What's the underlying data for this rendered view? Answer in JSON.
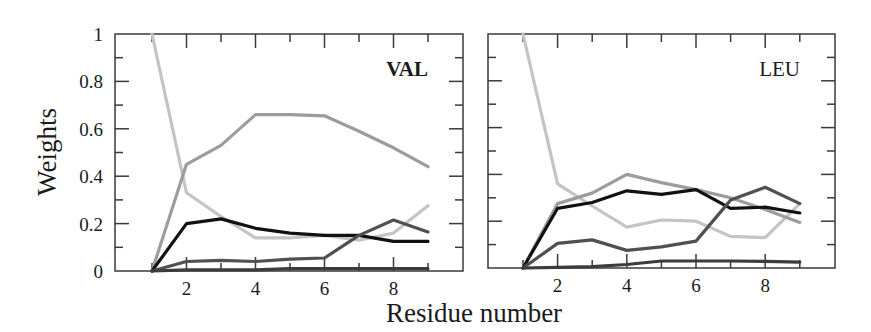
{
  "chart_data": [
    {
      "type": "line",
      "panel_label": "VAL",
      "panel_label_bold": true,
      "xlabel": "Residue number",
      "ylabel": "Weights",
      "xlim": [
        0,
        10
      ],
      "ylim": [
        0,
        1
      ],
      "x_ticks_labeled": [
        2,
        4,
        6,
        8
      ],
      "y_ticks_labeled": [
        "0",
        "0.2",
        "0.4",
        "0.6",
        "0.8",
        "1"
      ],
      "grid": false,
      "legend": null,
      "x": [
        1,
        2,
        3,
        4,
        5,
        6,
        7,
        8,
        9
      ],
      "series": [
        {
          "name": "light-gray",
          "color": "#c4c4c4",
          "values": [
            1.0,
            0.33,
            0.23,
            0.14,
            0.14,
            0.15,
            0.13,
            0.16,
            0.275
          ]
        },
        {
          "name": "mid-gray",
          "color": "#9c9c9c",
          "values": [
            0.0,
            0.45,
            0.53,
            0.66,
            0.66,
            0.655,
            0.59,
            0.52,
            0.44
          ]
        },
        {
          "name": "black",
          "color": "#111111",
          "values": [
            0.0,
            0.2,
            0.22,
            0.18,
            0.16,
            0.15,
            0.15,
            0.125,
            0.125
          ]
        },
        {
          "name": "dark-gray",
          "color": "#505050",
          "values": [
            0.0,
            0.04,
            0.045,
            0.04,
            0.05,
            0.055,
            0.15,
            0.215,
            0.165
          ]
        },
        {
          "name": "darkest-gray",
          "color": "#3c3c3c",
          "values": [
            0.0,
            0.005,
            0.005,
            0.005,
            0.01,
            0.01,
            0.01,
            0.01,
            0.01
          ]
        }
      ]
    },
    {
      "type": "line",
      "panel_label": "LEU",
      "panel_label_bold": false,
      "xlabel": "Residue number",
      "ylabel": "",
      "xlim": [
        0,
        10
      ],
      "ylim": [
        0,
        1
      ],
      "x_ticks_labeled": [
        2,
        4,
        6,
        8
      ],
      "y_ticks_labeled": [],
      "grid": false,
      "legend": null,
      "x": [
        1,
        2,
        3,
        4,
        5,
        6,
        7,
        8,
        9
      ],
      "series": [
        {
          "name": "light-gray",
          "color": "#c4c4c4",
          "values": [
            1.0,
            0.36,
            0.265,
            0.175,
            0.205,
            0.2,
            0.135,
            0.13,
            0.275
          ]
        },
        {
          "name": "mid-gray",
          "color": "#9c9c9c",
          "values": [
            0.0,
            0.275,
            0.32,
            0.4,
            0.365,
            0.335,
            0.3,
            0.25,
            0.195
          ]
        },
        {
          "name": "black",
          "color": "#111111",
          "values": [
            0.0,
            0.255,
            0.28,
            0.33,
            0.315,
            0.335,
            0.255,
            0.26,
            0.235
          ]
        },
        {
          "name": "dark-gray",
          "color": "#505050",
          "values": [
            0.0,
            0.105,
            0.12,
            0.075,
            0.09,
            0.115,
            0.29,
            0.345,
            0.275
          ]
        },
        {
          "name": "darkest-gray",
          "color": "#3c3c3c",
          "values": [
            0.0,
            0.003,
            0.006,
            0.015,
            0.03,
            0.03,
            0.03,
            0.028,
            0.025
          ]
        }
      ]
    }
  ],
  "labels": {
    "ylabel": "Weights",
    "xlabel": "Residue number",
    "panel_left": "VAL",
    "panel_right": "LEU"
  }
}
